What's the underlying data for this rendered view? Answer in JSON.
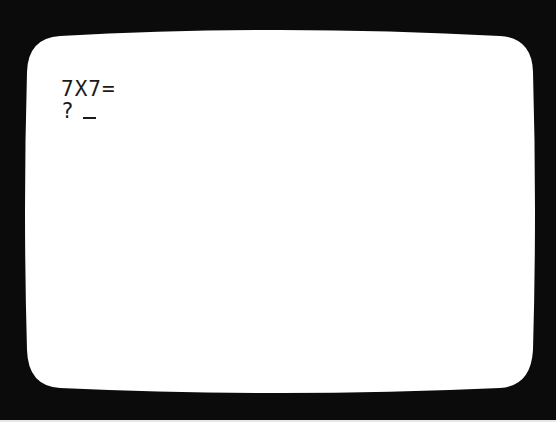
{
  "crt": {
    "bezel_color": "#0b0b0b",
    "screen_color": "#ffffff",
    "text_color": "#1a1a1a"
  },
  "terminal": {
    "lines": [
      {
        "text": "7X7="
      },
      {
        "prompt": "?",
        "input": "",
        "cursor": "_"
      }
    ]
  }
}
